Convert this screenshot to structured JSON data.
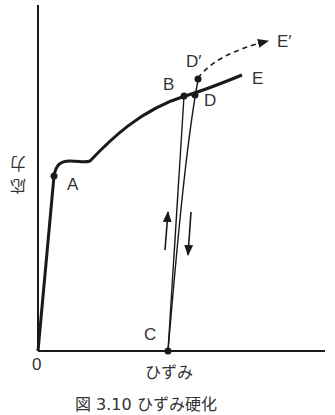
{
  "figure": {
    "caption": "図 3.10 ひずみ硬化",
    "y_axis_label": "応力",
    "x_axis_label": "ひずみ",
    "origin_label": "0"
  },
  "points": {
    "A": "A",
    "B": "B",
    "C": "C",
    "D": "D",
    "D_prime": "D′",
    "E": "E",
    "E_prime": "E′"
  },
  "colors": {
    "line": "#1a1a1a",
    "text": "#333333",
    "background": "#ffffff"
  }
}
